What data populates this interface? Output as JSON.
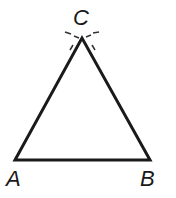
{
  "diagram": {
    "type": "triangle-construction",
    "vertices": [
      {
        "label": "A",
        "x": 15,
        "y": 160
      },
      {
        "label": "B",
        "x": 150,
        "y": 160
      },
      {
        "label": "C",
        "x": 82,
        "y": 38
      }
    ],
    "labels": {
      "a": "A",
      "b": "B",
      "c": "C"
    },
    "stroke_color": "#1a1a1a",
    "arc_marks_at": "C"
  }
}
